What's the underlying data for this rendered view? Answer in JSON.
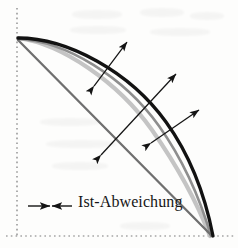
{
  "figure": {
    "kind": "technical-diagram",
    "caption_text": "Ist-Abweichung",
    "legend": {
      "marker_icon": "double-arrow-inward-icon",
      "label": "Ist-Abweichung"
    },
    "colors": {
      "nominal_curve": "#121212",
      "light_curve": "#c2c2c2",
      "mid_curve": "#8e8e8e",
      "chord_line": "#6f6f6f",
      "axis_dashed": "#7a7a7a",
      "arrow": "#141414",
      "background": "#fdfdfc"
    },
    "axes": {
      "vertical_dashed": {
        "x": 17,
        "y_start": 8,
        "y_end": 238
      },
      "horizontal_dashed": {
        "y": 236,
        "x_start": 6,
        "x_end": 236
      }
    },
    "curves": [
      {
        "name": "nominal-arc",
        "style": "solid-black-thick",
        "path": "M 18,38 C 68,38 130,72 166,122 C 192,158 206,200 213,236"
      },
      {
        "name": "light-gray-arc",
        "style": "solid-lightgray-thick",
        "path": "M 18,38 C 62,44 118,82 152,130 C 180,170 198,205 210,236"
      },
      {
        "name": "mid-gray-arc",
        "style": "solid-midgray",
        "path": "M 18,39 C 66,41 124,77 159,126 C 186,164 201,202 211,236"
      },
      {
        "name": "chord-line",
        "style": "solid-gray-straight",
        "path": "M 18,40 L 212,236"
      }
    ],
    "deviation_arrows": [
      {
        "name": "deviation-arrow-1",
        "x1": 94,
        "y1": 86,
        "x2": 127,
        "y2": 42
      },
      {
        "name": "deviation-arrow-2",
        "x1": 101,
        "y1": 155,
        "x2": 176,
        "y2": 74
      },
      {
        "name": "deviation-arrow-3",
        "x1": 151,
        "y1": 143,
        "x2": 199,
        "y2": 110
      }
    ],
    "arrow_count": 3
  }
}
